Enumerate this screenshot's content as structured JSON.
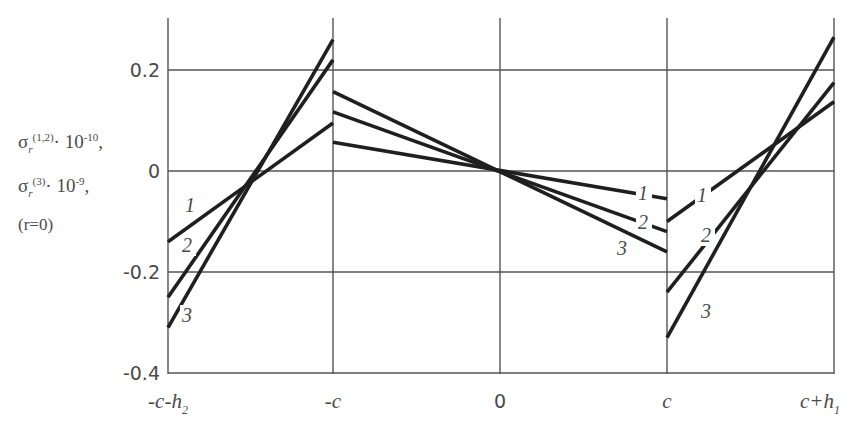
{
  "chart_data": {
    "type": "line",
    "title": "",
    "ylabel_lines": [
      "σr(1,2) · 10^-10,",
      "σr(3) · 10^-9,",
      "(r=0)"
    ],
    "ylabel_parts": {
      "line1_sym": "σ",
      "line1_sub": "r",
      "line1_sup": "(1,2)",
      "line1_mult": "· 10",
      "line1_exp": "-10",
      "line1_tail": ",",
      "line2_sym": "σ",
      "line2_sub": "r",
      "line2_sup": "(3)",
      "line2_mult": "· 10",
      "line2_exp": "-9",
      "line2_tail": ",",
      "line3": "(r=0)"
    },
    "xlabel": "",
    "x_ticks": [
      "-c-h2",
      "-c",
      "0",
      "c",
      "c+h1"
    ],
    "x_tick_display": [
      {
        "main": "-c-h",
        "sub": "2"
      },
      {
        "main": "-c",
        "sub": ""
      },
      {
        "main": "0",
        "sub": ""
      },
      {
        "main": "c",
        "sub": ""
      },
      {
        "main": "c+h",
        "sub": "1"
      }
    ],
    "y_ticks": [
      "0.2",
      "0",
      "-0.2",
      "-0.4"
    ],
    "ylim": [
      -0.4,
      0.27
    ],
    "grid": true,
    "legend": "inline curve labels 1, 2, 3",
    "segments": [
      "[-c-h2, -c]",
      "[-c, c]",
      "[c, c+h1]"
    ],
    "series": [
      {
        "name": "1",
        "points": {
          "-c-h2": -0.14,
          "-c_left": 0.095,
          "-c_right": 0.057,
          "0": 0.0,
          "c_left": -0.055,
          "c_right": -0.1,
          "c+h1": 0.137
        }
      },
      {
        "name": "2",
        "points": {
          "-c-h2": -0.25,
          "-c_left": 0.22,
          "-c_right": 0.117,
          "0": 0.0,
          "c_left": -0.12,
          "c_right": -0.24,
          "c+h1": 0.175
        }
      },
      {
        "name": "3",
        "points": {
          "-c-h2": -0.31,
          "-c_left": 0.26,
          "-c_right": 0.157,
          "0": 0.0,
          "c_left": -0.16,
          "c_right": -0.33,
          "c+h1": 0.265
        }
      }
    ],
    "curve_labels": [
      {
        "text": "1",
        "segment": "left",
        "x": 190,
        "y": 212
      },
      {
        "text": "2",
        "segment": "left",
        "x": 187,
        "y": 252
      },
      {
        "text": "3",
        "segment": "left",
        "x": 187,
        "y": 322
      },
      {
        "text": "1",
        "segment": "middle",
        "x": 643,
        "y": 200
      },
      {
        "text": "2",
        "segment": "middle",
        "x": 643,
        "y": 229
      },
      {
        "text": "3",
        "segment": "middle",
        "x": 622,
        "y": 255
      },
      {
        "text": "1",
        "segment": "right",
        "x": 702,
        "y": 202
      },
      {
        "text": "2",
        "segment": "right",
        "x": 706,
        "y": 242
      },
      {
        "text": "3",
        "segment": "right",
        "x": 706,
        "y": 318
      }
    ]
  }
}
